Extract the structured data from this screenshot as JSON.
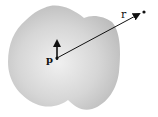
{
  "diagram": {
    "body": {
      "fill": "#c8c8c8",
      "highlight": "#ececec"
    },
    "dipole": {
      "label": "p",
      "origin": [
        57,
        58
      ],
      "tip": [
        57,
        40
      ]
    },
    "position_vector": {
      "label": "r",
      "from": [
        57,
        58
      ],
      "to": [
        141,
        13
      ]
    },
    "field_point": {
      "position": [
        144,
        12
      ]
    },
    "colors": {
      "ink": "#111111"
    }
  }
}
